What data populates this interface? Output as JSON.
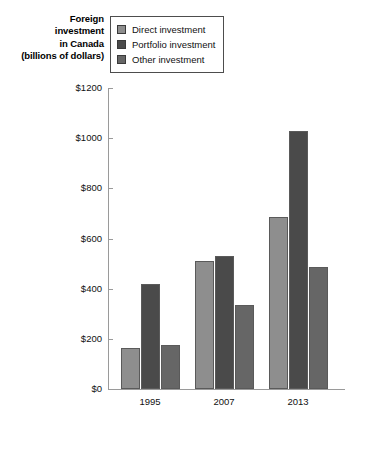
{
  "title": {
    "lines": [
      "Foreign",
      "investment",
      "in Canada",
      "(billions of dollars)"
    ]
  },
  "legend": {
    "position": "top-left-inside",
    "items": [
      {
        "label": "Direct investment",
        "color": "#8e8e8e",
        "swatch_name": "legend-swatch-direct"
      },
      {
        "label": "Portfolio investment",
        "color": "#4a4a4a",
        "swatch_name": "legend-swatch-portfolio"
      },
      {
        "label": "Other investment",
        "color": "#666666",
        "swatch_name": "legend-swatch-other"
      }
    ]
  },
  "axis": {
    "y_ticks": [
      "$0",
      "$200",
      "$400",
      "$600",
      "$800",
      "$1000",
      "$1200"
    ],
    "x_ticks": [
      "1995",
      "2007",
      "2013"
    ]
  },
  "chart_data": {
    "type": "bar",
    "title": "Foreign investment in Canada (billions of dollars)",
    "xlabel": "",
    "ylabel": "Foreign investment in Canada (billions of dollars)",
    "categories": [
      "1995",
      "2007",
      "2013"
    ],
    "series": [
      {
        "name": "Direct investment",
        "color": "#8e8e8e",
        "values": [
          165,
          510,
          685
        ]
      },
      {
        "name": "Portfolio investment",
        "color": "#4a4a4a",
        "values": [
          420,
          530,
          1030
        ]
      },
      {
        "name": "Other investment",
        "color": "#666666",
        "values": [
          175,
          335,
          485
        ]
      }
    ],
    "ylim": [
      0,
      1200
    ],
    "ytick_values": [
      0,
      200,
      400,
      600,
      800,
      1000,
      1200
    ],
    "ytick_labels": [
      "$0",
      "$200",
      "$400",
      "$600",
      "$800",
      "$1000",
      "$1200"
    ],
    "grid": false,
    "legend_position": "upper left (inside, boxed)"
  }
}
